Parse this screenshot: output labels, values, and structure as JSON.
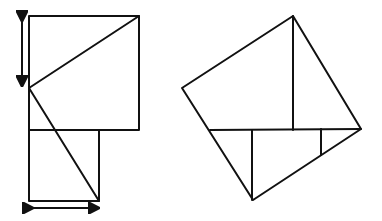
{
  "figure": {
    "description": "Dissection proof of the Pythagorean theorem",
    "left_panel": {
      "name": "Two adjacent squares with hypotenuse cuts",
      "squares": [
        "large square",
        "small square"
      ],
      "markers": [
        "vertical double arrow (side of small square)",
        "horizontal double arrow (side of small square)"
      ]
    },
    "right_panel": {
      "name": "Pieces rearranged into tilted square on hypotenuse"
    },
    "colors": {
      "stroke": "#111111",
      "background": "#ffffff"
    }
  }
}
